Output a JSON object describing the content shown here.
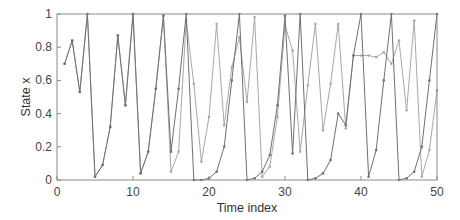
{
  "chart_data": {
    "type": "line",
    "title": "",
    "xlabel": "Time index",
    "ylabel": "State x",
    "xlim": [
      0,
      50
    ],
    "ylim": [
      0,
      1
    ],
    "xticks": [
      0,
      10,
      20,
      30,
      40,
      50
    ],
    "yticks": [
      0,
      0.2,
      0.4,
      0.6,
      0.8,
      1
    ],
    "ytick_labels": [
      "0",
      "0.2",
      "0.4",
      "0.6",
      "0.8",
      "1"
    ],
    "grid": false,
    "legend": null,
    "series": [
      {
        "name": "series-dark",
        "color": "#707070",
        "marker": "dot",
        "x": [
          1,
          2,
          3,
          4,
          5,
          6,
          7,
          8,
          9,
          10,
          11,
          12,
          13,
          14,
          15,
          16,
          17,
          18,
          19,
          20,
          21,
          22,
          23,
          24,
          25,
          26,
          27,
          28,
          29,
          30,
          31,
          32,
          33,
          34,
          35,
          36,
          37,
          38,
          39,
          40,
          41,
          42,
          43,
          44,
          45,
          46,
          47,
          48,
          49,
          50
        ],
        "values": [
          0.7,
          0.84,
          0.53,
          1.0,
          0.02,
          0.09,
          0.32,
          0.87,
          0.45,
          1.0,
          0.04,
          0.17,
          0.55,
          0.99,
          0.17,
          0.55,
          1.0,
          0.0,
          0.0,
          0.01,
          0.05,
          0.2,
          0.6,
          1.0,
          0.0,
          0.01,
          0.05,
          0.15,
          0.45,
          0.99,
          0.16,
          1.0,
          0.0,
          0.01,
          0.04,
          0.12,
          0.4,
          0.33,
          0.75,
          1.0,
          0.02,
          0.18,
          0.6,
          1.0,
          0.0,
          0.01,
          0.05,
          0.2,
          0.6,
          1.0
        ]
      },
      {
        "name": "series-light",
        "color": "#a8a8a8",
        "marker": "dot",
        "x": [
          1,
          2,
          3,
          4,
          5,
          6,
          7,
          8,
          9,
          10,
          11,
          12,
          13,
          14,
          15,
          16,
          17,
          18,
          19,
          20,
          21,
          22,
          23,
          24,
          25,
          26,
          27,
          28,
          29,
          30,
          31,
          32,
          33,
          34,
          35,
          36,
          37,
          38,
          39,
          40,
          41,
          42,
          43,
          44,
          45,
          46,
          47,
          48,
          49,
          50
        ],
        "values": [
          0.7,
          0.84,
          0.53,
          1.0,
          0.02,
          0.09,
          0.32,
          0.87,
          0.45,
          1.0,
          0.04,
          0.17,
          0.55,
          0.99,
          0.05,
          0.17,
          0.96,
          0.58,
          0.11,
          0.38,
          0.94,
          0.33,
          0.68,
          0.86,
          0.47,
          0.98,
          0.02,
          0.08,
          0.38,
          0.93,
          0.78,
          0.17,
          0.57,
          0.94,
          0.3,
          0.58,
          0.94,
          0.31,
          0.75,
          0.75,
          0.75,
          0.74,
          0.77,
          0.7,
          0.84,
          0.42,
          0.96,
          0.02,
          0.18,
          0.54
        ]
      }
    ]
  }
}
